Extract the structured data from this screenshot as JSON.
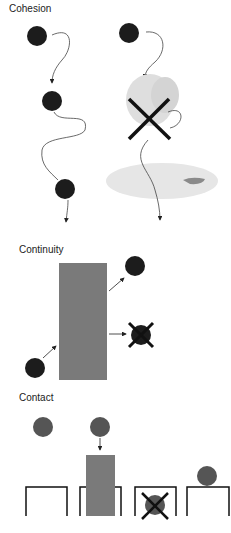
{
  "panels": {
    "cohesion": {
      "title": "Cohesion"
    },
    "continuity": {
      "title": "Continuity"
    },
    "contact": {
      "title": "Contact"
    }
  },
  "colors": {
    "ball_dark": "#1c1c1c",
    "ball_gray": "#555555",
    "block_gray": "#7a7a7a",
    "x_mark": "#111111",
    "blob": "#e3e3e3",
    "line": "#333333"
  }
}
